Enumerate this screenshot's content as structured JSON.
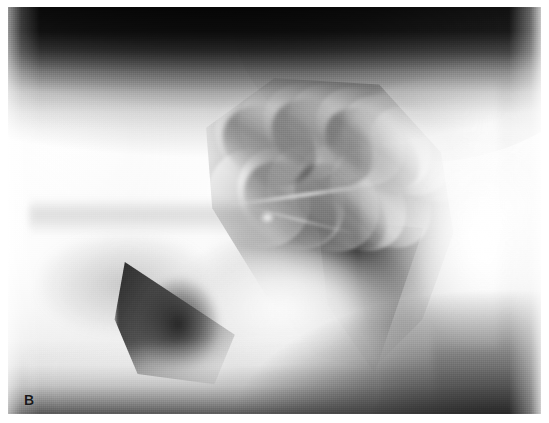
{
  "figure": {
    "kind": "radiograph",
    "modality": "x-ray",
    "view": "lateral thoracic radiograph",
    "panel_label": "B",
    "orientation": "cranial-left, dorsal-up",
    "background_color": "#ffffff",
    "plate": {
      "left": 8,
      "top": 7,
      "width": 533,
      "height": 407
    }
  },
  "palette": {
    "page_background": "#ffffff",
    "plate_mid_gray": "#9a9a9a",
    "brightest_soft_tissue": "#ffffff",
    "lung_field_dark": "#2a2a2a",
    "collimation_black": "#121212",
    "label_color": "#1a1a1a"
  },
  "regions": [
    {
      "id": "collimation-band-top",
      "name": "dorsal collimation band",
      "tone": "black"
    },
    {
      "id": "shoulder-mass",
      "name": "cranial shoulder and forelimb musculature",
      "tone": "very bright"
    },
    {
      "id": "spine-ridge",
      "name": "thoracic vertebral column",
      "tone": "bright"
    },
    {
      "id": "dorsal-body-wall",
      "name": "dorsal body wall contour",
      "tone": "bright"
    },
    {
      "id": "caudodorsal-lung-field",
      "name": "caudodorsal lung field",
      "tone": "dark"
    },
    {
      "id": "rib-shadows",
      "name": "rib shadows over lung field",
      "tone": "mixed"
    },
    {
      "id": "pulmonary-vessels",
      "name": "hilar pulmonary vessels",
      "tone": "bright streaks"
    },
    {
      "id": "cardiac-silhouette",
      "name": "cardiac silhouette",
      "tone": "bright soft tissue"
    },
    {
      "id": "caudoventral-gas",
      "name": "caudoventral lung / cardiophrenic gas wedge",
      "tone": "dark wedge"
    },
    {
      "id": "diaphragm-liver",
      "name": "diaphragm and liver",
      "tone": "very bright"
    },
    {
      "id": "sternum",
      "name": "sternum and ventral body wall",
      "tone": "bright"
    },
    {
      "id": "collimation-band-bottom",
      "name": "ventral collimation band",
      "tone": "dark"
    }
  ],
  "ribs": [
    {
      "left": "40%",
      "top": "19%",
      "width": "17%",
      "height": "26%",
      "rot": -62
    },
    {
      "left": "45%",
      "top": "17%",
      "width": "17%",
      "height": "28%",
      "rot": -60
    },
    {
      "left": "50%",
      "top": "16%",
      "width": "17%",
      "height": "30%",
      "rot": -58
    },
    {
      "left": "55%",
      "top": "16%",
      "width": "17%",
      "height": "31%",
      "rot": -56
    },
    {
      "left": "60%",
      "top": "17%",
      "width": "17%",
      "height": "31%",
      "rot": -54
    },
    {
      "left": "65%",
      "top": "19%",
      "width": "16%",
      "height": "30%",
      "rot": -52
    },
    {
      "left": "70%",
      "top": "22%",
      "width": "15%",
      "height": "28%",
      "rot": -50
    },
    {
      "left": "38%",
      "top": "34%",
      "width": "18%",
      "height": "26%",
      "rot": -54
    },
    {
      "left": "44%",
      "top": "33%",
      "width": "18%",
      "height": "28%",
      "rot": -52
    },
    {
      "left": "50%",
      "top": "32%",
      "width": "18%",
      "height": "30%",
      "rot": -50
    },
    {
      "left": "56%",
      "top": "32%",
      "width": "17%",
      "height": "30%",
      "rot": -48
    },
    {
      "left": "62%",
      "top": "33%",
      "width": "16%",
      "height": "28%",
      "rot": -46
    }
  ],
  "rib_dark": [
    {
      "left": "42%",
      "top": "22%",
      "width": "14%",
      "height": "24%",
      "rot": -61
    },
    {
      "left": "52%",
      "top": "20%",
      "width": "14%",
      "height": "27%",
      "rot": -57
    },
    {
      "left": "62%",
      "top": "22%",
      "width": "13%",
      "height": "26%",
      "rot": -53
    },
    {
      "left": "46%",
      "top": "36%",
      "width": "14%",
      "height": "25%",
      "rot": -51
    },
    {
      "left": "56%",
      "top": "36%",
      "width": "13%",
      "height": "26%",
      "rot": -48
    }
  ]
}
